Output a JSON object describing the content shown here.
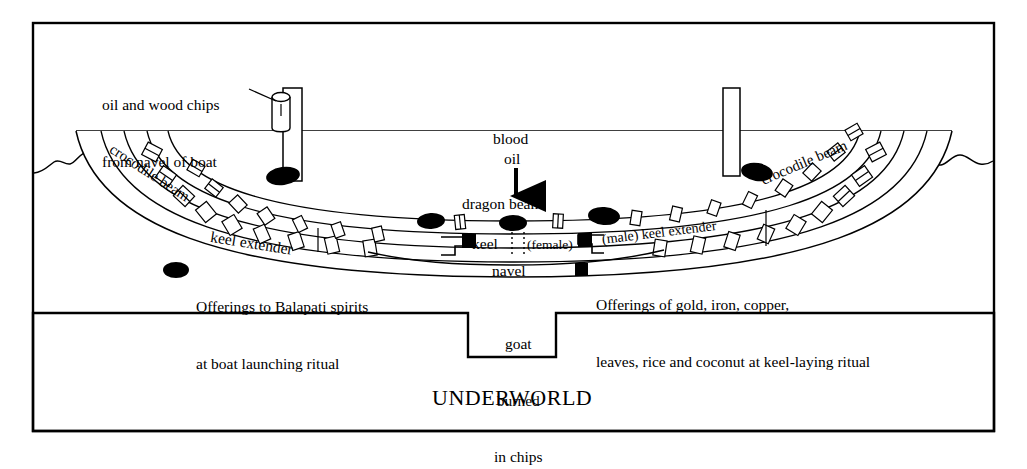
{
  "figure": {
    "kind": "boat-cross-section-ritual-diagram",
    "frame_color": "#000000",
    "background": "#ffffff"
  },
  "annotations": {
    "oil_wood_chips": "oil and wood chips\nfrom navel of boat",
    "oil_wood_chips_line1": "oil and wood chips",
    "oil_wood_chips_line2": "from navel of boat",
    "blood": "blood",
    "oil": "oil",
    "dragon_beam": "dragon beam",
    "crocodile_beam_left": "crocodile beam",
    "crocodile_beam_right": "crocodile beam",
    "keel_extender_left": "keel extender",
    "keel": "keel",
    "female": "(female)",
    "male_keel_extender": "(male) keel extender",
    "navel": "navel",
    "goat_line1": "goat",
    "goat_line2": "burned",
    "goat_line3": "in chips",
    "underworld": "UNDERWORLD"
  },
  "legend": {
    "items": [
      {
        "marker": "filled-ellipse",
        "marker_color": "#000000",
        "line1": "Offerings to Balapati spirits",
        "line2": "at boat launching ritual"
      },
      {
        "marker": "filled-square",
        "marker_color": "#000000",
        "line1": "Offerings of gold, iron, copper,",
        "line2": "leaves, rice and coconut at keel-laying ritual"
      }
    ]
  },
  "markers": {
    "ellipse_offerings": [
      {
        "cx": 283,
        "cy": 176,
        "rx": 17,
        "ry": 9,
        "rot": -8
      },
      {
        "cx": 431,
        "cy": 221,
        "rx": 14,
        "ry": 8,
        "rot": -4
      },
      {
        "cx": 513,
        "cy": 223,
        "rx": 14,
        "ry": 8,
        "rot": 0
      },
      {
        "cx": 604,
        "cy": 216,
        "rx": 16,
        "ry": 9,
        "rot": 4
      },
      {
        "cx": 757,
        "cy": 172,
        "rx": 16,
        "ry": 9,
        "rot": 9
      }
    ],
    "square_offerings": [
      {
        "x": 463,
        "y": 234,
        "w": 13,
        "h": 13
      },
      {
        "x": 578,
        "y": 233,
        "w": 13,
        "h": 13
      }
    ]
  },
  "structure": {
    "waterline_label": "water surface",
    "deck_line_y": 131,
    "masts": [
      {
        "x": 283,
        "y_top": 88,
        "w": 18,
        "h": 93
      },
      {
        "x": 724,
        "y_top": 88,
        "w": 16,
        "h": 88
      }
    ],
    "vessel_cylinder": {
      "x": 272,
      "y": 90,
      "w": 18,
      "h": 40
    }
  }
}
